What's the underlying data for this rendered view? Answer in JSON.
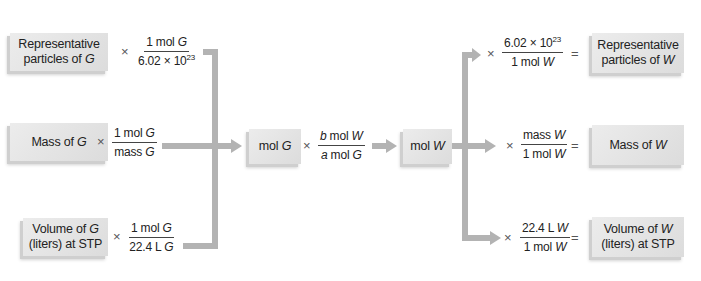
{
  "diagram": {
    "type": "flow",
    "title": "",
    "left": [
      {
        "box_parts": [
          "Representative",
          "particles of ",
          "G"
        ],
        "operator": "×",
        "numerator": [
          "1 mol ",
          "G"
        ],
        "denominator": [
          "6.02 × 10",
          "23"
        ]
      },
      {
        "box_parts": [
          "Mass of ",
          "G"
        ],
        "operator": "×",
        "numerator": [
          "1 mol ",
          "G"
        ],
        "denominator": [
          "mass ",
          "G"
        ]
      },
      {
        "box_parts": [
          "Volume of ",
          "G",
          "(liters) at STP"
        ],
        "operator": "×",
        "numerator": [
          "1 mol ",
          "G"
        ],
        "denominator": [
          "22.4 L ",
          "G"
        ]
      }
    ],
    "center": {
      "mol_g_box": [
        "mol ",
        "G"
      ],
      "operator": "×",
      "numerator": [
        "b",
        " mol ",
        "W"
      ],
      "denominator": [
        "a",
        " mol ",
        "G"
      ],
      "mol_w_box": [
        "mol ",
        "W"
      ]
    },
    "right": [
      {
        "operator": "×",
        "numerator": [
          "6.02 × 10",
          "23"
        ],
        "denominator": [
          "1 mol ",
          "W"
        ],
        "equals": "=",
        "box_parts": [
          "Representative",
          "particles of ",
          "W"
        ]
      },
      {
        "operator": "×",
        "numerator": [
          "mass ",
          "W"
        ],
        "denominator": [
          "1 mol ",
          "W"
        ],
        "equals": "=",
        "box_parts": [
          "Mass of ",
          "W"
        ]
      },
      {
        "operator": "×",
        "numerator": [
          "22.4 L ",
          "W"
        ],
        "denominator": [
          "1 mol ",
          "W"
        ],
        "equals": "=",
        "box_parts": [
          "Volume of ",
          "W",
          "(liters) at STP"
        ]
      }
    ],
    "colors": {
      "box": "#e4e4e4",
      "connector": "#b3b3b3",
      "text": "#222222"
    }
  }
}
